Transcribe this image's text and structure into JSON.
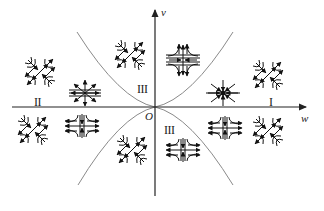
{
  "diagram": {
    "type": "phase-portrait-regions",
    "axes": {
      "horizontal_label": "w",
      "vertical_label": "v",
      "origin_label": "O"
    },
    "regions": [
      {
        "id": "I",
        "label": "I",
        "x": 269,
        "y": 96
      },
      {
        "id": "II",
        "label": "II",
        "x": 34,
        "y": 96
      },
      {
        "id": "III-upper",
        "label": "III",
        "x": 137,
        "y": 83
      },
      {
        "id": "III-lower",
        "label": "III",
        "x": 164,
        "y": 124
      }
    ],
    "curves": [
      {
        "name": "parabola-upper-left",
        "desc": "boundary curve w = -c v^2, v>0"
      },
      {
        "name": "parabola-upper-right",
        "desc": "boundary curve w = c v^2, v>0"
      },
      {
        "name": "parabola-lower-left",
        "desc": "boundary curve w = -c v^2, v<0"
      },
      {
        "name": "parabola-lower-right",
        "desc": "boundary curve w = c v^2, v<0"
      }
    ],
    "glyphs": [
      {
        "kind": "saddle-diagonal",
        "x": 40,
        "y": 72
      },
      {
        "kind": "source-star",
        "x": 85,
        "y": 93
      },
      {
        "kind": "saddle-diagonal",
        "x": 130,
        "y": 55
      },
      {
        "kind": "saddle-cross-vertical-out",
        "x": 183,
        "y": 60
      },
      {
        "kind": "sink-star",
        "x": 223,
        "y": 93
      },
      {
        "kind": "saddle-diagonal",
        "x": 268,
        "y": 75
      },
      {
        "kind": "saddle-diagonal",
        "x": 33,
        "y": 128
      },
      {
        "kind": "saddle-cross-horizontal-out",
        "x": 82,
        "y": 126
      },
      {
        "kind": "saddle-diagonal",
        "x": 132,
        "y": 150
      },
      {
        "kind": "saddle-cross-horizontal-out",
        "x": 183,
        "y": 150
      },
      {
        "kind": "saddle-cross-horizontal-out",
        "x": 225,
        "y": 128
      },
      {
        "kind": "saddle-diagonal",
        "x": 268,
        "y": 130
      }
    ],
    "colors": {
      "axis": "#222222",
      "curve": "#8a8a8a",
      "glyph": "#111111",
      "background": "#ffffff"
    }
  }
}
